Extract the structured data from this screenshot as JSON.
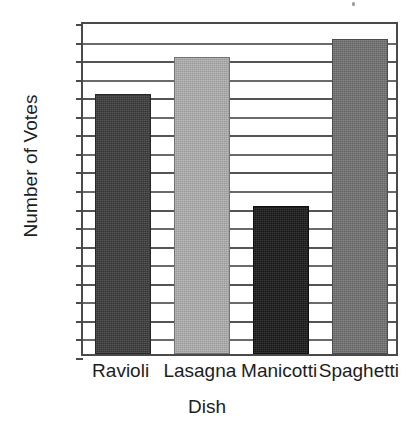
{
  "chart_data": {
    "type": "bar",
    "title": "",
    "xlabel": "Dish",
    "ylabel": "Number of Votes",
    "categories": [
      "Ravioli",
      "Lasagna",
      "Manicotti",
      "Spaghetti"
    ],
    "values": [
      56,
      64,
      32,
      68
    ],
    "series": [
      {
        "name": "Number of Votes",
        "values": [
          56,
          64,
          32,
          68
        ]
      }
    ],
    "ylim": [
      0,
      72
    ],
    "xlim_note": "categorical",
    "y_major_ticks": [
      0,
      8,
      16,
      24,
      32,
      40,
      48,
      56,
      64,
      72
    ],
    "y_major_tick_labels": [
      "0",
      "8",
      "16",
      "24",
      "32",
      "40",
      "48",
      "56",
      "64",
      "72"
    ],
    "y_minor_ticks": [
      4,
      12,
      20,
      28,
      36,
      44,
      52,
      60,
      68
    ],
    "y_tick_step": 8,
    "grid": "horizontal",
    "legend": "none",
    "bar_colors": [
      "#3d3d3d",
      "#b0b0b0",
      "#1a1a1a",
      "#737373"
    ],
    "frame_color": "#4a4a4a",
    "background_color": "#ffffff",
    "annotations": []
  },
  "axes": {
    "y_title": "Number of Votes",
    "x_title": "Dish"
  }
}
